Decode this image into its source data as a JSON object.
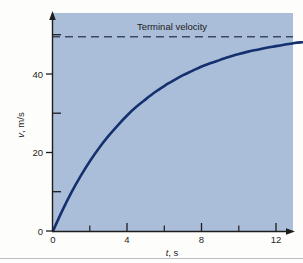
{
  "figure": {
    "background_color": "#fdfdfc",
    "plot_background_color": "#aabdd8",
    "curve_color": "#14306f",
    "axis_color": "#1d1d1d",
    "dash_color": "#3a4a63"
  },
  "axes": {
    "x_title": "t, s",
    "x_title_symbol": "t",
    "x_title_unit": ", s",
    "y_title": "v, m/s",
    "y_title_symbol": "v",
    "y_title_unit": ", m/s",
    "x_ticks": [
      "0",
      "4",
      "8",
      "12"
    ],
    "y_ticks": [
      "0",
      "20",
      "40"
    ],
    "x_origin_label": "0",
    "y_origin_label": "0"
  },
  "annotations": {
    "terminal_velocity_label": "Terminal velocity"
  },
  "chart_data": {
    "type": "line",
    "title": "",
    "xlabel": "t, s",
    "ylabel": "v, m/s",
    "xlim": [
      0,
      13.4
    ],
    "ylim": [
      0,
      55.5
    ],
    "grid": false,
    "legend": "none",
    "x_major_ticks": [
      0,
      4,
      8,
      12
    ],
    "x_minor_ticks": [
      2,
      6,
      10
    ],
    "y_major_ticks": [
      0,
      20,
      40
    ],
    "y_minor_ticks": [
      10,
      30,
      50
    ],
    "annotations": [
      {
        "type": "hline",
        "label": "Terminal velocity",
        "y": 49.5,
        "style": "dashed"
      }
    ],
    "series": [
      {
        "name": "v(t)",
        "model": "v_T * (1 - exp(-t/tau))",
        "terminal_velocity": 49.5,
        "tau": 4.5,
        "x": [
          0,
          0.5,
          1,
          1.5,
          2,
          2.5,
          3,
          3.5,
          4,
          4.5,
          5,
          5.5,
          6,
          6.5,
          7,
          7.5,
          8,
          8.5,
          9,
          9.5,
          10,
          10.5,
          11,
          11.5,
          12,
          12.5,
          13,
          13.4
        ],
        "values": [
          0,
          5.2,
          9.9,
          14.1,
          17.9,
          21.3,
          24.3,
          27.0,
          29.5,
          31.7,
          33.6,
          35.4,
          37.0,
          38.4,
          39.7,
          40.8,
          41.9,
          42.8,
          43.6,
          44.4,
          45.1,
          45.7,
          46.2,
          46.7,
          47.1,
          47.5,
          47.9,
          48.1
        ]
      }
    ]
  }
}
